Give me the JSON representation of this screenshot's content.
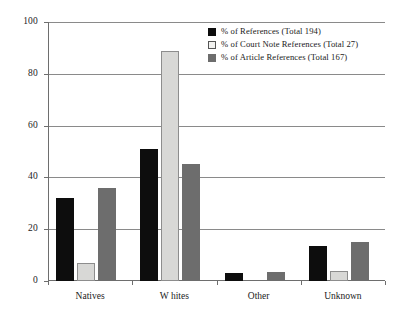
{
  "chart_data": {
    "type": "bar",
    "title": "",
    "subtitle": "",
    "xlabel": "",
    "ylabel": "",
    "ylim": [
      0,
      100
    ],
    "yticks": [
      0,
      20,
      40,
      60,
      80,
      100
    ],
    "ytick_labels": [
      "0",
      "20",
      "40",
      "60",
      "80",
      "100"
    ],
    "grid": true,
    "legend_position": "top-right",
    "categories": [
      "Natives",
      "W hites",
      "Other",
      "Unknown"
    ],
    "series": [
      {
        "name": "% of References (Total 194)",
        "color": "#0d0d0d",
        "values": [
          32,
          51,
          3,
          13.5
        ]
      },
      {
        "name": "% of  Court Note References (Total 27)",
        "color": "#d8d8d6",
        "values": [
          7,
          89,
          0,
          4
        ]
      },
      {
        "name": "% of  Article References (Total 167)",
        "color": "#6d6d6d",
        "values": [
          36,
          45,
          3.5,
          15
        ]
      }
    ]
  },
  "legend": {
    "entries": [
      "% of References (Total 194)",
      "% of  Court Note References (Total 27)",
      "% of  Article References (Total 167)"
    ]
  }
}
